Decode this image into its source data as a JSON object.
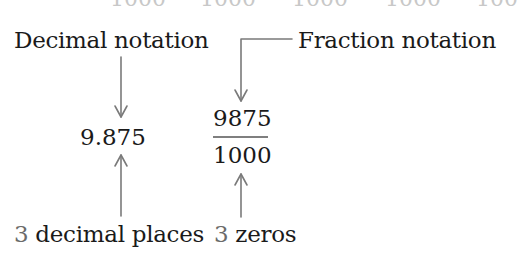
{
  "top_row_fragments": [
    "1000",
    "1000",
    "1000",
    "1000",
    "100"
  ],
  "labels": {
    "decimal_notation": "Decimal notation",
    "fraction_notation": "Fraction notation"
  },
  "values": {
    "decimal": "9.875",
    "numerator": "9875",
    "denominator": "1000"
  },
  "annotations": {
    "decimal_places_count": "3",
    "decimal_places_text": " decimal places",
    "zeros_count": "3",
    "zeros_text": " zeros"
  },
  "colors": {
    "text": "#1a1a1a",
    "count_digit": "#6b6b6b",
    "arrow": "#7a7a7a"
  }
}
